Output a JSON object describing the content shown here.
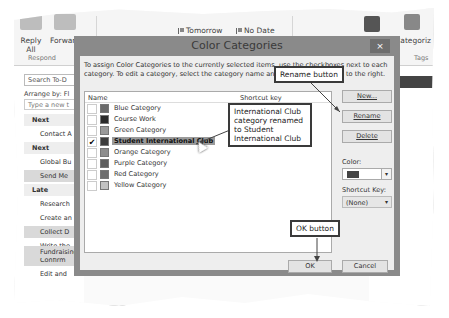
{
  "ribbon": {
    "respond": {
      "reply_all": "Reply All",
      "forward": "Forward",
      "group_label": "Respond"
    },
    "mark": "Mark",
    "remove": "Remove",
    "followup": {
      "tomorrow": "Tomorrow",
      "no_date": "No Date",
      "next_week": "Next W...",
      "this_week": "This W..."
    },
    "change": "Change",
    "move": "Move",
    "onenote": "OneNote",
    "categorize": "Categoriz",
    "tags_label": "Tags"
  },
  "left_pane": {
    "search_placeholder": "Search To-D",
    "arrange_by": "Arrange by: Fl",
    "type_new_placeholder": "Type a new t",
    "rows": [
      {
        "label": "Next",
        "type": "group"
      },
      {
        "label": "Contact A",
        "type": "item"
      },
      {
        "label": "Next",
        "type": "group"
      },
      {
        "label": "Global Bu",
        "type": "item"
      },
      {
        "label": "Send Me",
        "type": "selected"
      },
      {
        "label": "Late",
        "type": "group"
      },
      {
        "label": "Research",
        "type": "item"
      },
      {
        "label": "Create an",
        "type": "item"
      },
      {
        "label": "Collect D",
        "type": "selected"
      },
      {
        "label": "Write the",
        "type": "item"
      },
      {
        "label": "Confirm",
        "type": "selected"
      },
      {
        "label": "Edit and",
        "type": "item"
      }
    ],
    "bottom_row": "Fundraising Project"
  },
  "dialog": {
    "title": "Color Categories",
    "close": "×",
    "instructions": "To assign Color Categories to the currently selected items, use the checkboxes next to each category.  To edit a category, select the category name and use the commands to the right.",
    "list_header": {
      "name": "Name",
      "shortcut": "Shortcut key"
    },
    "categories": [
      {
        "name": "Blue Category",
        "color": "#6b6b6b",
        "checked": false,
        "selected": false
      },
      {
        "name": "Course Work",
        "color": "#2a2a2a",
        "checked": false,
        "selected": false
      },
      {
        "name": "Green Category",
        "color": "#9a9a9a",
        "checked": false,
        "selected": false
      },
      {
        "name": "Student International Club",
        "color": "#3d3d3d",
        "checked": true,
        "selected": true
      },
      {
        "name": "Orange Category",
        "color": "#8d8d8d",
        "checked": false,
        "selected": false
      },
      {
        "name": "Purple Category",
        "color": "#5e5e5e",
        "checked": false,
        "selected": false
      },
      {
        "name": "Red Category",
        "color": "#6e6e6e",
        "checked": false,
        "selected": false
      },
      {
        "name": "Yellow Category",
        "color": "#c2c2c2",
        "checked": false,
        "selected": false
      }
    ],
    "buttons": {
      "new": "New...",
      "rename": "Rename",
      "delete": "Delete",
      "ok": "OK",
      "cancel": "Cancel"
    },
    "color_label": "Color:",
    "color_value": "#444444",
    "shortcut_label": "Shortcut Key:",
    "shortcut_value": "(None)"
  },
  "callouts": {
    "rename": "Rename button",
    "renamed": "International Club category renamed to Student International Club",
    "ok": "OK button"
  },
  "check_glyph": "✔",
  "dropdown_glyph": "▾"
}
